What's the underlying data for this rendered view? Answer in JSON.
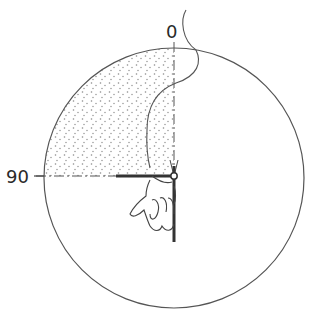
{
  "diagram": {
    "labels": {
      "top": "0",
      "left": "90"
    },
    "colors": {
      "line": "#555555",
      "dark": "#333333",
      "stipple": "#8a8a8a",
      "background": "#ffffff"
    },
    "geometry": {
      "circle": {
        "cx": 174,
        "cy": 178,
        "r": 130
      },
      "shaded_sector": "0 to 90 (upper-left quadrant)"
    }
  }
}
